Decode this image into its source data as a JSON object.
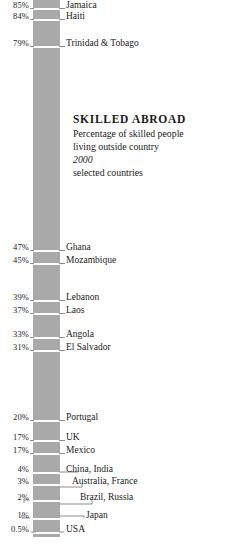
{
  "chart_data": {
    "type": "bar",
    "title": "SKILLED ABROAD",
    "subtitle": "Percentage of skilled people living outside country",
    "year": "2000",
    "note": "selected countries",
    "xlabel": "",
    "ylabel": "Percentage of skilled people living outside country",
    "orientation": "vertical-scale",
    "grid": false,
    "legend": false,
    "ylim": [
      0,
      85
    ],
    "bar_color": "#a9a9a9",
    "categories": [
      "Jamaica",
      "Haiti",
      "Trinidad & Tobago",
      "Ghana",
      "Mozambique",
      "Lebanon",
      "Laos",
      "Angola",
      "El Salvador",
      "Portugal",
      "UK",
      "Mexico",
      "China, India",
      "Australia, France",
      "Brazil, Russia",
      "Japan",
      "USA"
    ],
    "values": [
      85,
      84,
      79,
      47,
      45,
      39,
      37,
      33,
      31,
      20,
      17,
      17,
      4,
      3,
      2,
      1,
      0.5
    ],
    "value_labels": [
      "85%",
      "84%",
      "79%",
      "47%",
      "45%",
      "39%",
      "37%",
      "33%",
      "31%",
      "20%",
      "17%",
      "17%",
      "4%",
      "3%",
      "2%",
      "1%",
      "0.5%"
    ]
  },
  "header": {
    "title": "SKILLED ABROAD",
    "subtitle_line1": "Percentage of skilled people",
    "subtitle_line2": "living outside country",
    "year": "2000",
    "note": "selected countries"
  },
  "rows": [
    {
      "pct": "85%",
      "country": "Jamaica",
      "y": 8
    },
    {
      "pct": "84%",
      "country": "Haiti",
      "y": 19
    },
    {
      "pct": "79%",
      "country": "Trinidad & Tobago",
      "y": 46
    },
    {
      "pct": "47%",
      "country": "Ghana",
      "y": 250
    },
    {
      "pct": "45%",
      "country": "Mozambique",
      "y": 263
    },
    {
      "pct": "39%",
      "country": "Lebanon",
      "y": 300
    },
    {
      "pct": "37%",
      "country": "Laos",
      "y": 313
    },
    {
      "pct": "33%",
      "country": "Angola",
      "y": 337
    },
    {
      "pct": "31%",
      "country": "El Salvador",
      "y": 350
    },
    {
      "pct": "20%",
      "country": "Portugal",
      "y": 420
    },
    {
      "pct": "17%",
      "country": "UK",
      "y": 440
    },
    {
      "pct": "17%",
      "country": "Mexico",
      "y": 453
    },
    {
      "pct": "4%",
      "country": "China, India",
      "y": 472
    },
    {
      "pct": "3%",
      "country": "Australia, France",
      "y": 484
    },
    {
      "pct": "2%",
      "country": "Brazil, Russia",
      "y": 500
    },
    {
      "pct": "1%",
      "country": "Japan",
      "y": 518
    },
    {
      "pct": "0.5%",
      "country": "USA",
      "y": 532
    }
  ],
  "colors": {
    "bar": "#a9a9a9",
    "tick": "#ffffff",
    "leader": "#8c8c8c",
    "text": "#1a1a1a",
    "background": "#ffffff"
  }
}
